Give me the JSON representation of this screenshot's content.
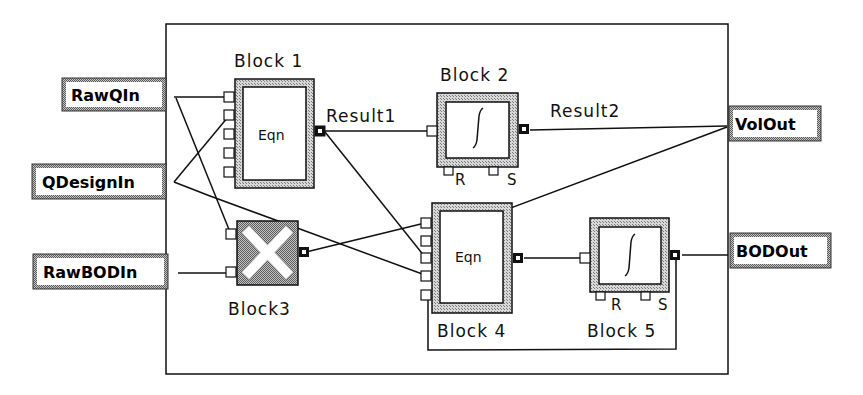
{
  "diagram": {
    "inputs": [
      {
        "id": "rawqin",
        "label": "RawQIn"
      },
      {
        "id": "qdesignin",
        "label": "QDesignIn"
      },
      {
        "id": "rawbodin",
        "label": "RawBODIn"
      }
    ],
    "outputs": [
      {
        "id": "volout",
        "label": "VolOut"
      },
      {
        "id": "bodout",
        "label": "BODOut"
      }
    ],
    "blocks": [
      {
        "id": "block1",
        "label": "Block 1",
        "type": "equation",
        "body": "Eqn"
      },
      {
        "id": "block2",
        "label": "Block 2",
        "type": "integrator",
        "body": "∫",
        "ports": [
          "R",
          "S"
        ]
      },
      {
        "id": "block3",
        "label": "Block3",
        "type": "multiplier",
        "body": "×"
      },
      {
        "id": "block4",
        "label": "Block 4",
        "type": "equation",
        "body": "Eqn"
      },
      {
        "id": "block5",
        "label": "Block 5",
        "type": "integrator",
        "body": "∫",
        "ports": [
          "R",
          "S"
        ]
      }
    ],
    "signals": [
      {
        "id": "result1",
        "label": "Result1"
      },
      {
        "id": "result2",
        "label": "Result2"
      }
    ],
    "colors": {
      "line": "#111111",
      "hatch": "#9a9a9a",
      "background": "#ffffff"
    }
  }
}
